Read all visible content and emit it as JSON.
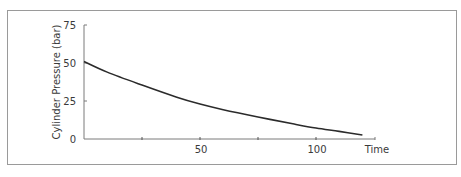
{
  "chart_data": {
    "type": "line",
    "title": "",
    "xlabel": "Time",
    "ylabel": "Cylinder Pressure (bar)",
    "xlim": [
      0,
      125
    ],
    "ylim": [
      0,
      75
    ],
    "x_ticks": [
      25,
      50,
      75,
      100
    ],
    "x_tick_labels": [
      {
        "value": 50,
        "label": "50"
      },
      {
        "value": 100,
        "label": "100"
      }
    ],
    "y_ticks": [
      {
        "value": 0,
        "label": "0"
      },
      {
        "value": 25,
        "label": "25"
      },
      {
        "value": 50,
        "label": "50"
      },
      {
        "value": 75,
        "label": "75"
      }
    ],
    "grid": false,
    "legend": "none",
    "series": [
      {
        "name": "Cylinder Pressure",
        "color": "#2b2b2b",
        "x": [
          0,
          10,
          25,
          40,
          50,
          60,
          75,
          90,
          100,
          110,
          120
        ],
        "y": [
          51,
          44,
          35.5,
          27.5,
          23,
          19.3,
          14.5,
          10,
          7.2,
          5,
          2.6
        ]
      }
    ]
  }
}
